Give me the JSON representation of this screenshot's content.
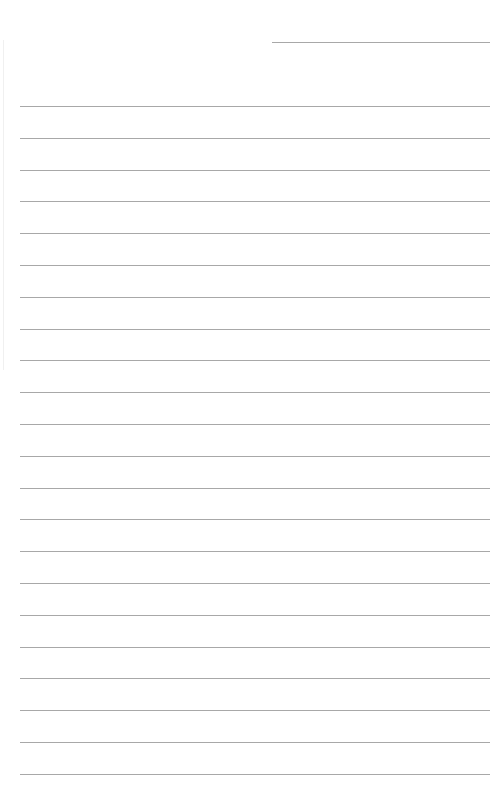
{
  "page": {
    "type": "lined-paper",
    "header_line": {
      "x": 272,
      "y": 42,
      "x_end": 490
    },
    "rule_lines": {
      "start_y": 106,
      "spacing": 31.8,
      "count": 22,
      "x_start": 20,
      "x_end": 490
    },
    "line_color": "#a8a8a8",
    "background": "#ffffff"
  }
}
